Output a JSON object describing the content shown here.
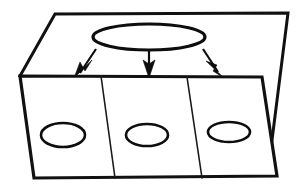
{
  "figure": {
    "title": "",
    "caption": "",
    "background_color": "#ffffff",
    "ink_color": "#0d0d0d"
  },
  "upper_plane": {
    "name": "upper-plane",
    "stroke_color": "#111111",
    "stroke_width": 3,
    "fill_color": "#ffffff",
    "points": "55,14 288,13 268,172 20,76"
  },
  "lower_plane": {
    "name": "lower-plane",
    "stroke_color": "#111111",
    "stroke_width": 3.2,
    "fill_color": "#ffffff",
    "points": "20,76 262,77 277,176 34,178"
  },
  "dividers": [
    {
      "label": "divider-left",
      "x1": 101,
      "y1": 76,
      "x2": 115,
      "y2": 178,
      "stroke_width": 1.6
    },
    {
      "label": "divider-right",
      "x1": 187,
      "y1": 77,
      "x2": 202,
      "y2": 178,
      "stroke_width": 1.6
    }
  ],
  "source_ellipse": {
    "label": "source-ellipse",
    "cx": 149,
    "cy": 37,
    "rx": 56,
    "ry": 13,
    "stroke_width": 3.2
  },
  "target_ellipses": [
    {
      "label": "target-ellipse-left",
      "cx": 63,
      "cy": 135,
      "rx": 22,
      "ry": 12,
      "stroke_width": 2.6
    },
    {
      "label": "target-ellipse-middle",
      "cx": 147,
      "cy": 135,
      "rx": 21,
      "ry": 11,
      "stroke_width": 2.6
    },
    {
      "label": "target-ellipse-right",
      "cx": 229,
      "cy": 132,
      "rx": 21,
      "ry": 10,
      "stroke_width": 2.6
    }
  ],
  "arrows": [
    {
      "label": "arrow-left",
      "x1": 96,
      "y1": 49,
      "x2": 80,
      "y2": 73,
      "stroke_width": 2.2,
      "head": "74,78 92,60 85,71 80,62"
    },
    {
      "label": "arrow-middle",
      "x1": 149,
      "y1": 50,
      "x2": 149,
      "y2": 70,
      "stroke_width": 2.2,
      "head": "149,78 143,60 149,64 155,60"
    },
    {
      "label": "arrow-right",
      "x1": 203,
      "y1": 49,
      "x2": 218,
      "y2": 72,
      "stroke_width": 2.2,
      "head": "224,78 206,61 217,65 213,71"
    }
  ]
}
